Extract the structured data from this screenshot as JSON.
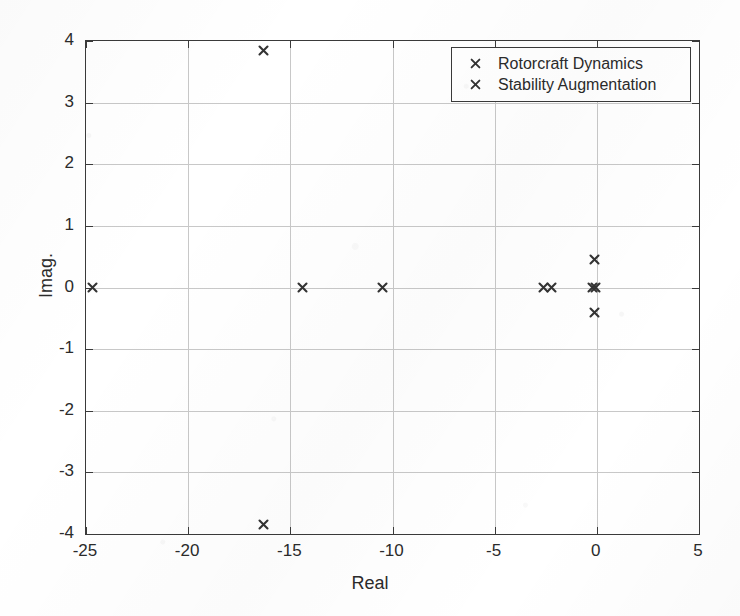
{
  "chart_data": {
    "type": "scatter",
    "title": "",
    "xlabel": "Real",
    "ylabel": "Imag.",
    "xlim": [
      -25,
      5
    ],
    "ylim": [
      -4,
      4
    ],
    "xticks": [
      -25,
      -20,
      -15,
      -10,
      -5,
      0,
      5
    ],
    "xticklabels": [
      "-25",
      "-20",
      "-15",
      "-10",
      "-5",
      "0",
      "5"
    ],
    "yticks": [
      -4,
      -3,
      -2,
      -1,
      0,
      1,
      2,
      3,
      4
    ],
    "yticklabels": [
      "-4",
      "-3",
      "-2",
      "-1",
      "0",
      "1",
      "2",
      "3",
      "4"
    ],
    "grid": true,
    "legend_position": "upper right",
    "marker": "x",
    "series": [
      {
        "name": "Rotorcraft Dynamics",
        "marker": "x",
        "color": "#333333",
        "points": [
          {
            "x": -24.7,
            "y": 0.0
          },
          {
            "x": -16.3,
            "y": 3.85
          },
          {
            "x": -16.3,
            "y": -3.85
          },
          {
            "x": -14.4,
            "y": 0.0
          },
          {
            "x": -10.5,
            "y": 0.0
          },
          {
            "x": -2.6,
            "y": 0.0
          },
          {
            "x": -2.2,
            "y": 0.0
          },
          {
            "x": -0.2,
            "y": 0.0
          },
          {
            "x": -0.1,
            "y": 0.45
          },
          {
            "x": -0.1,
            "y": -0.4
          }
        ]
      },
      {
        "name": "Stability Augmentation",
        "marker": "x",
        "color": "#333333",
        "points": [
          {
            "x": -0.05,
            "y": 0.0
          }
        ]
      }
    ]
  },
  "legend": {
    "entries": [
      {
        "label": "Rotorcraft Dynamics",
        "marker_name": "legend-marker-x"
      },
      {
        "label": "Stability Augmentation",
        "marker_name": "legend-marker-x"
      }
    ]
  },
  "axes": {
    "xlabel": "Real",
    "ylabel": "Imag."
  }
}
